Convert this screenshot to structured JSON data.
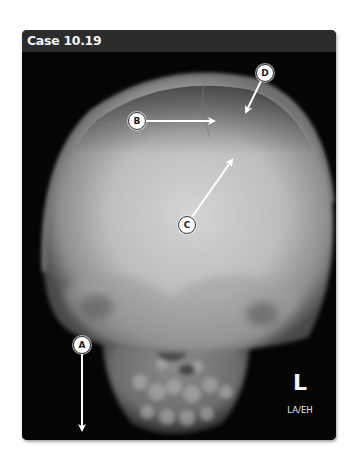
{
  "figure": {
    "title": "Case 10.19",
    "image_type": "skull radiograph (frontal view)",
    "side_marker": "L",
    "operator_initials": "LA/EH",
    "colors": {
      "header_bg": "#2c2c2c",
      "frame_bg": "#050505",
      "title_text": "#f2f2f2",
      "callout_fill": "#ffffff",
      "arrow": "#ffffff"
    }
  },
  "annotations": [
    {
      "label": "A",
      "circle": [
        82,
        345
      ],
      "arrow_tip": [
        82,
        431
      ]
    },
    {
      "label": "B",
      "circle": [
        137,
        121
      ],
      "arrow_tip": [
        215,
        121
      ]
    },
    {
      "label": "C",
      "circle": [
        187,
        225
      ],
      "arrow_tip": [
        233,
        159
      ]
    },
    {
      "label": "D",
      "circle": [
        265,
        73
      ],
      "arrow_tip": [
        245,
        113
      ]
    }
  ]
}
